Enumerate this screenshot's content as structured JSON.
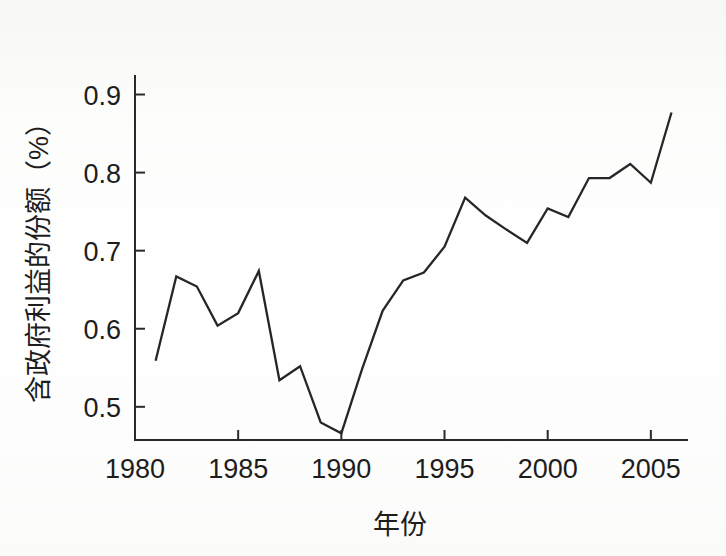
{
  "figure": {
    "background_color": "#fbfbfa",
    "line_color": "#262626",
    "axis_color": "#2a2a2a"
  },
  "chart_data": {
    "type": "line",
    "title": "",
    "xlabel": "年份",
    "ylabel": "含政府利益的份额（%）",
    "xlim": [
      1980,
      2006.8
    ],
    "ylim": [
      0.4575,
      0.925
    ],
    "grid": false,
    "legend": null,
    "xticks": [
      1980,
      1985,
      1990,
      1995,
      2000,
      2005
    ],
    "xticklabels": [
      "1980",
      "1985",
      "1990",
      "1995",
      "2000",
      "2005"
    ],
    "yticks": [
      0.5,
      0.6,
      0.7,
      0.8,
      0.9
    ],
    "yticklabels": [
      "0.5",
      "0.6",
      "0.7",
      "0.8",
      "0.9"
    ],
    "x": [
      1981,
      1982,
      1983,
      1984,
      1985,
      1986,
      1987,
      1988,
      1989,
      1990,
      1991,
      1992,
      1993,
      1994,
      1995,
      1996,
      1997,
      1998,
      1999,
      2000,
      2001,
      2002,
      2003,
      2004,
      2005,
      2006
    ],
    "series": [
      {
        "name": "含政府利益的份额",
        "values": [
          0.559,
          0.667,
          0.654,
          0.604,
          0.62,
          0.674,
          0.534,
          0.552,
          0.48,
          0.466,
          0.548,
          0.623,
          0.662,
          0.672,
          0.705,
          0.768,
          0.745,
          0.727,
          0.71,
          0.754,
          0.743,
          0.793,
          0.793,
          0.811,
          0.787,
          0.877
        ]
      }
    ]
  }
}
